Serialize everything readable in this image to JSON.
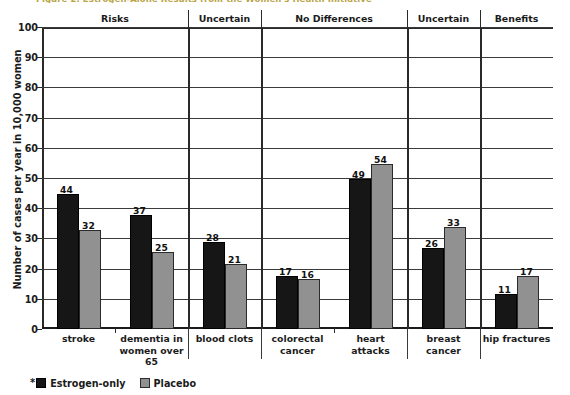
{
  "figure": {
    "title_partial": "Figure 2. Estrogen-Alone Results from the Women's Health Initiative"
  },
  "legend": {
    "asterisk": "*",
    "series": [
      {
        "name": "Estrogen-only",
        "color": "#161616"
      },
      {
        "name": "Placebo",
        "color": "#919191"
      }
    ]
  },
  "category_bands": [
    {
      "label": "Risks",
      "span": [
        0,
        1
      ]
    },
    {
      "label": "Uncertain",
      "span": [
        2,
        2
      ]
    },
    {
      "label": "No Differences",
      "span": [
        3,
        4
      ]
    },
    {
      "label": "Uncertain",
      "span": [
        5,
        5
      ]
    },
    {
      "label": "Benefits",
      "span": [
        6,
        6
      ]
    }
  ],
  "chart_data": {
    "type": "bar",
    "title": "Figure 2. Estrogen-Alone Results from the Women's Health Initiative",
    "xlabel": "",
    "ylabel": "Number of cases per year in 10,000 women",
    "ylim": [
      0,
      100
    ],
    "yticks": [
      0,
      10,
      20,
      30,
      40,
      50,
      60,
      70,
      80,
      90,
      100
    ],
    "grid": true,
    "legend_position": "bottom-left",
    "categories": [
      "stroke",
      "dementia in women over 65",
      "blood clots",
      "colorectal cancer",
      "heart attacks",
      "breast cancer",
      "hip fractures"
    ],
    "category_lines": [
      [
        "stroke"
      ],
      [
        "dementia in",
        "women over",
        "65"
      ],
      [
        "blood clots"
      ],
      [
        "colorectal",
        "cancer"
      ],
      [
        "heart attacks"
      ],
      [
        "breast cancer"
      ],
      [
        "hip fractures"
      ]
    ],
    "series": [
      {
        "name": "Estrogen-only",
        "color": "#161616",
        "values": [
          44,
          37,
          28,
          17,
          49,
          26,
          11
        ]
      },
      {
        "name": "Placebo",
        "color": "#919191",
        "values": [
          32,
          25,
          21,
          16,
          54,
          33,
          17
        ]
      }
    ],
    "group_bands": [
      "Risks",
      "Risks",
      "Uncertain",
      "No Differences",
      "No Differences",
      "Uncertain",
      "Benefits"
    ]
  }
}
